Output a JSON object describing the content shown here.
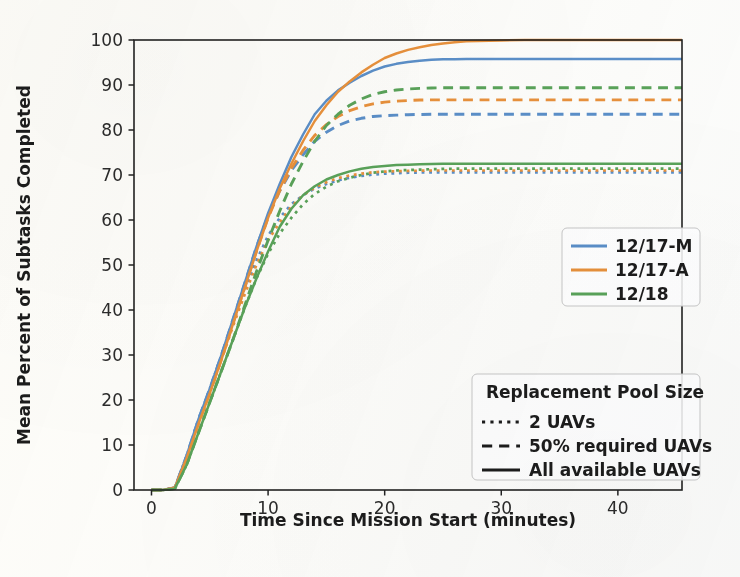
{
  "figure": {
    "background_color": "#fdfdfb",
    "plot_area": {
      "left": 134,
      "top": 40,
      "right": 682,
      "bottom": 490
    }
  },
  "chart_data": {
    "type": "line",
    "title": "",
    "subtitle": "",
    "xlabel": "Time Since Mission Start (minutes)",
    "ylabel": "Mean Percent of Subtasks Completed",
    "xlim": [
      -1.5,
      45.5
    ],
    "ylim": [
      0,
      100
    ],
    "xticks": [
      0,
      10,
      20,
      30,
      40
    ],
    "yticks": [
      0,
      10,
      20,
      30,
      40,
      50,
      60,
      70,
      80,
      90,
      100
    ],
    "xtick_labels": [
      "0",
      "10",
      "20",
      "30",
      "40"
    ],
    "ytick_labels": [
      "0",
      "10",
      "20",
      "30",
      "40",
      "50",
      "60",
      "70",
      "80",
      "90",
      "100"
    ],
    "grid": false,
    "colors": {
      "12/17-M": "#5b8fc9",
      "12/17-A": "#e8913c",
      "12/18": "#5aa35a"
    },
    "linestyles": {
      "2 UAVs": "dotted",
      "50% required UAVs": "dashed",
      "All available UAVs": "solid"
    },
    "x": [
      0,
      1,
      2,
      3,
      4,
      5,
      6,
      7,
      8,
      9,
      10,
      11,
      12,
      13,
      14,
      15,
      16,
      17,
      18,
      19,
      20,
      21,
      22,
      23,
      24,
      25,
      26,
      27,
      28,
      30,
      32,
      34,
      36,
      38,
      40,
      42,
      44,
      45.5
    ],
    "series": [
      {
        "name": "12/17-M All available UAVs",
        "dataset": "12/17-M",
        "pool": "All available UAVs",
        "color": "#5b8fc9",
        "linestyle": "solid",
        "final_value": 95.8,
        "values": [
          0,
          0,
          0.5,
          7.5,
          15.5,
          22.5,
          30,
          38,
          46,
          54,
          61.5,
          68,
          74,
          79,
          83.5,
          86.5,
          88.8,
          90.5,
          92,
          93.2,
          94.1,
          94.7,
          95.1,
          95.4,
          95.6,
          95.7,
          95.75,
          95.8,
          95.8,
          95.8,
          95.8,
          95.8,
          95.8,
          95.8,
          95.8,
          95.8,
          95.8,
          95.8
        ]
      },
      {
        "name": "12/17-A All available UAVs",
        "dataset": "12/17-A",
        "pool": "All available UAVs",
        "color": "#e8913c",
        "linestyle": "solid",
        "final_value": 100,
        "values": [
          0,
          0,
          0.5,
          7,
          14.5,
          21.5,
          29,
          37,
          45,
          53,
          60.5,
          67,
          72.5,
          77.5,
          82,
          85.5,
          88.5,
          90.8,
          92.8,
          94.5,
          96,
          97,
          97.8,
          98.4,
          98.9,
          99.2,
          99.5,
          99.7,
          99.8,
          99.9,
          100,
          100,
          100,
          100,
          100,
          100,
          100,
          100
        ]
      },
      {
        "name": "12/18 All available UAVs",
        "dataset": "12/18",
        "pool": "All available UAVs",
        "color": "#5aa35a",
        "linestyle": "solid",
        "final_value": 72.5,
        "values": [
          0,
          0,
          0.3,
          5.5,
          12.5,
          19.5,
          26.5,
          33.5,
          40.5,
          47,
          53,
          58.5,
          62.5,
          65.5,
          67.5,
          69,
          70,
          70.8,
          71.4,
          71.8,
          72,
          72.2,
          72.3,
          72.4,
          72.45,
          72.5,
          72.5,
          72.5,
          72.5,
          72.5,
          72.5,
          72.5,
          72.5,
          72.5,
          72.5,
          72.5,
          72.5,
          72.5
        ]
      },
      {
        "name": "12/17-M 50% required UAVs",
        "dataset": "12/17-M",
        "pool": "50% required UAVs",
        "color": "#5b8fc9",
        "linestyle": "dashed",
        "final_value": 83.5,
        "values": [
          0,
          0,
          0.5,
          7.5,
          15.5,
          22.5,
          30,
          38,
          46,
          54,
          61,
          66.5,
          71,
          74.5,
          77.5,
          79.5,
          81,
          82,
          82.6,
          83,
          83.2,
          83.3,
          83.4,
          83.45,
          83.5,
          83.5,
          83.5,
          83.5,
          83.5,
          83.5,
          83.5,
          83.5,
          83.5,
          83.5,
          83.5,
          83.5,
          83.5,
          83.5
        ]
      },
      {
        "name": "12/17-A 50% required UAVs",
        "dataset": "12/17-A",
        "pool": "50% required UAVs",
        "color": "#e8913c",
        "linestyle": "dashed",
        "final_value": 86.7,
        "values": [
          0,
          0,
          0.5,
          7,
          14.5,
          21.5,
          29,
          37,
          45,
          53,
          60.5,
          66.5,
          71.5,
          75.5,
          78.8,
          81.2,
          83,
          84.3,
          85.2,
          85.8,
          86.2,
          86.4,
          86.55,
          86.65,
          86.7,
          86.7,
          86.7,
          86.7,
          86.7,
          86.7,
          86.7,
          86.7,
          86.7,
          86.7,
          86.7,
          86.7,
          86.7,
          86.7
        ]
      },
      {
        "name": "12/18 50% required UAVs",
        "dataset": "12/18",
        "pool": "50% required UAVs",
        "color": "#5aa35a",
        "linestyle": "dashed",
        "final_value": 89.4,
        "values": [
          0,
          0,
          0.3,
          5.5,
          12.5,
          19.5,
          26.5,
          33.5,
          41,
          48.5,
          55.5,
          62,
          68,
          73,
          77.5,
          81,
          83.5,
          85.5,
          86.9,
          87.9,
          88.5,
          88.9,
          89.1,
          89.25,
          89.35,
          89.4,
          89.4,
          89.4,
          89.4,
          89.4,
          89.4,
          89.4,
          89.4,
          89.4,
          89.4,
          89.4,
          89.4,
          89.4
        ]
      },
      {
        "name": "12/17-M 2 UAVs",
        "dataset": "12/17-M",
        "pool": "2 UAVs",
        "color": "#5b8fc9",
        "linestyle": "dotted",
        "final_value": 70.6,
        "values": [
          0,
          0,
          0.5,
          7.5,
          15.5,
          22.5,
          30,
          37.5,
          44.5,
          51,
          56.5,
          60.5,
          63.5,
          65.5,
          67,
          68,
          68.8,
          69.4,
          69.8,
          70.1,
          70.3,
          70.4,
          70.5,
          70.55,
          70.6,
          70.6,
          70.6,
          70.6,
          70.6,
          70.6,
          70.6,
          70.6,
          70.6,
          70.6,
          70.6,
          70.6,
          70.6,
          70.6
        ]
      },
      {
        "name": "12/17-A 2 UAVs",
        "dataset": "12/17-A",
        "pool": "2 UAVs",
        "color": "#e8913c",
        "linestyle": "dotted",
        "final_value": 71.0,
        "values": [
          0,
          0,
          0.5,
          7,
          14.5,
          21.5,
          29,
          36.5,
          43.5,
          50,
          55.5,
          59.5,
          63,
          65.5,
          67.2,
          68.4,
          69.3,
          69.9,
          70.3,
          70.6,
          70.75,
          70.85,
          70.9,
          70.95,
          71,
          71,
          71,
          71,
          71,
          71,
          71,
          71,
          71,
          71,
          71,
          71,
          71,
          71
        ]
      },
      {
        "name": "12/18 2 UAVs",
        "dataset": "12/18",
        "pool": "2 UAVs",
        "color": "#5aa35a",
        "linestyle": "dotted",
        "final_value": 71.4,
        "values": [
          0,
          0,
          0.3,
          5.5,
          12.5,
          19.5,
          26.5,
          33.5,
          40.5,
          47,
          52.5,
          57,
          60.5,
          63.5,
          65.8,
          67.4,
          68.6,
          69.4,
          70,
          70.5,
          70.8,
          71,
          71.1,
          71.2,
          71.3,
          71.35,
          71.4,
          71.4,
          71.4,
          71.4,
          71.4,
          71.4,
          71.4,
          71.4,
          71.4,
          71.4,
          71.4,
          71.4
        ]
      }
    ]
  },
  "legend_datasets": {
    "name": "dataset-legend",
    "entries": [
      {
        "label": "12/17-M",
        "color": "#5b8fc9",
        "linestyle": "solid"
      },
      {
        "label": "12/17-A",
        "color": "#e8913c",
        "linestyle": "solid"
      },
      {
        "label": "12/18",
        "color": "#5aa35a",
        "linestyle": "solid"
      }
    ]
  },
  "legend_pool": {
    "name": "pool-legend",
    "title": "Replacement Pool Size",
    "entries": [
      {
        "label": "2 UAVs",
        "linestyle": "dotted",
        "color": "#1c1c1c"
      },
      {
        "label": "50% required UAVs",
        "linestyle": "dashed",
        "color": "#1c1c1c"
      },
      {
        "label": "All available UAVs",
        "linestyle": "solid",
        "color": "#1c1c1c"
      }
    ]
  }
}
